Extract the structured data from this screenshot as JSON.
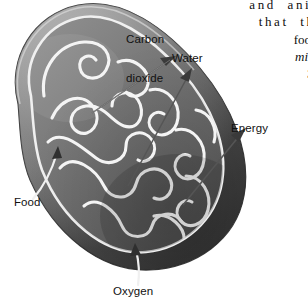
{
  "figure": {
    "style": "grayscale-textbook-illustration",
    "labels": {
      "carbon_dioxide_line1": "Carbon",
      "carbon_dioxide_line2": "dioxide",
      "water": "Water",
      "energy": "Energy",
      "food": "Food",
      "oxygen": "Oxygen"
    },
    "arrows": [
      {
        "name": "carbon-dioxide-arrow",
        "direction": "out",
        "label": "Carbon dioxide"
      },
      {
        "name": "water-arrow",
        "direction": "out",
        "label": "Water"
      },
      {
        "name": "energy-arrow",
        "direction": "out",
        "label": "Energy"
      },
      {
        "name": "food-arrow",
        "direction": "in",
        "label": "Food"
      },
      {
        "name": "oxygen-arrow",
        "direction": "in",
        "label": "Oxygen"
      }
    ],
    "colors": {
      "outer_membrane": "#6b6b6b",
      "inner_matrix": "#7a7a7a",
      "crista_highlight": "#f2f2f2",
      "background": "#ffffff",
      "label_text": "#111111"
    }
  },
  "body_text": {
    "lines": [
      "and  anim",
      "that  the",
      "food. ",
      "mitoc",
      "3-8",
      "ti"
    ],
    "line_styles": [
      "roman",
      "roman",
      "roman",
      "italic",
      "bold",
      "roman"
    ]
  }
}
